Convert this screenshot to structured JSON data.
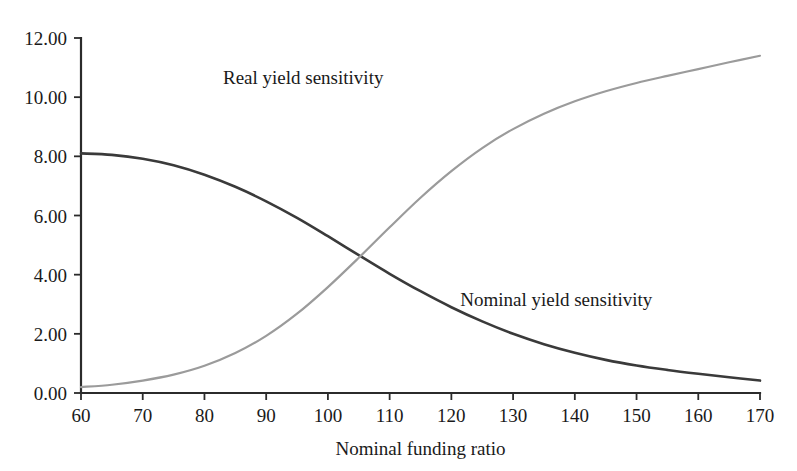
{
  "chart_data": {
    "type": "line",
    "title": "",
    "xlabel": "Nominal funding ratio",
    "ylabel": "",
    "xlim": [
      60,
      170
    ],
    "ylim": [
      0.0,
      12.0
    ],
    "grid": false,
    "legend_position": "inline-annotations",
    "x_ticks": [
      "60",
      "70",
      "80",
      "90",
      "100",
      "110",
      "120",
      "130",
      "140",
      "150",
      "160",
      "170"
    ],
    "y_ticks": [
      "0.00",
      "2.00",
      "4.00",
      "6.00",
      "8.00",
      "10.00",
      "12.00"
    ],
    "x": [
      60,
      65,
      70,
      75,
      80,
      85,
      90,
      95,
      100,
      105,
      110,
      115,
      120,
      125,
      130,
      135,
      140,
      145,
      150,
      155,
      160,
      165,
      170
    ],
    "series": [
      {
        "name": "Nominal yield sensitivity",
        "color": "#3a3a3a",
        "width": 2.6,
        "label_x": 137,
        "label_y": 2.95,
        "values": [
          8.1,
          8.05,
          7.92,
          7.7,
          7.38,
          6.97,
          6.48,
          5.92,
          5.3,
          4.66,
          4.03,
          3.44,
          2.9,
          2.42,
          2.0,
          1.65,
          1.36,
          1.12,
          0.93,
          0.78,
          0.65,
          0.53,
          0.42
        ]
      },
      {
        "name": "Real yield sensitivity",
        "color": "#9b9b9b",
        "width": 2.2,
        "label_x": 96,
        "label_y": 10.45,
        "values": [
          0.2,
          0.28,
          0.42,
          0.62,
          0.92,
          1.35,
          1.93,
          2.68,
          3.58,
          4.57,
          5.6,
          6.6,
          7.5,
          8.28,
          8.92,
          9.44,
          9.86,
          10.2,
          10.48,
          10.72,
          10.95,
          11.18,
          11.4
        ]
      }
    ]
  },
  "geometry": {
    "plot_left": 81,
    "plot_right": 760,
    "plot_bottom": 393,
    "plot_top": 38
  }
}
